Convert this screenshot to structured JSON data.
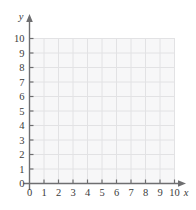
{
  "figure": {
    "kind": "blank-coordinate-grid",
    "title": "",
    "background_color": "#ffffff"
  },
  "chart_data": {
    "type": "scatter",
    "title": "",
    "xlabel": "x",
    "ylabel": "y",
    "xlim": [
      0,
      10
    ],
    "ylim": [
      0,
      10
    ],
    "x_ticks": [
      0,
      1,
      2,
      3,
      4,
      5,
      6,
      7,
      8,
      9,
      10
    ],
    "y_ticks": [
      0,
      1,
      2,
      3,
      4,
      5,
      6,
      7,
      8,
      9,
      10
    ],
    "x_tick_labels": [
      "0",
      "1",
      "2",
      "3",
      "4",
      "5",
      "6",
      "7",
      "8",
      "9",
      "10"
    ],
    "y_tick_labels": [
      "0",
      "1",
      "2",
      "3",
      "4",
      "5",
      "6",
      "7",
      "8",
      "9",
      "10"
    ],
    "grid": true,
    "legend": null,
    "series": [],
    "annotations": []
  },
  "axes": {
    "x_axis_label": "x",
    "y_axis_label": "y",
    "x_tick_labels": [
      "0",
      "1",
      "2",
      "3",
      "4",
      "5",
      "6",
      "7",
      "8",
      "9",
      "10"
    ],
    "y_tick_labels": [
      "10",
      "9",
      "8",
      "7",
      "6",
      "5",
      "4",
      "3",
      "2",
      "1",
      "0"
    ],
    "arrowheads": [
      "x-axis-arrow",
      "y-axis-arrow"
    ]
  },
  "colors": {
    "plot_fill": "#f7f7f8",
    "grid_line": "#e2e2e4",
    "grid_border": "#e2e2e4",
    "axis_line": "#6e6e70",
    "tick_mark": "#6e6e70",
    "text": "#3b3b3b"
  },
  "geometry": {
    "origin_x": 29.5,
    "origin_y": 183.5,
    "step": 14.5,
    "grid_top": 38.5,
    "grid_right": 174.5
  }
}
